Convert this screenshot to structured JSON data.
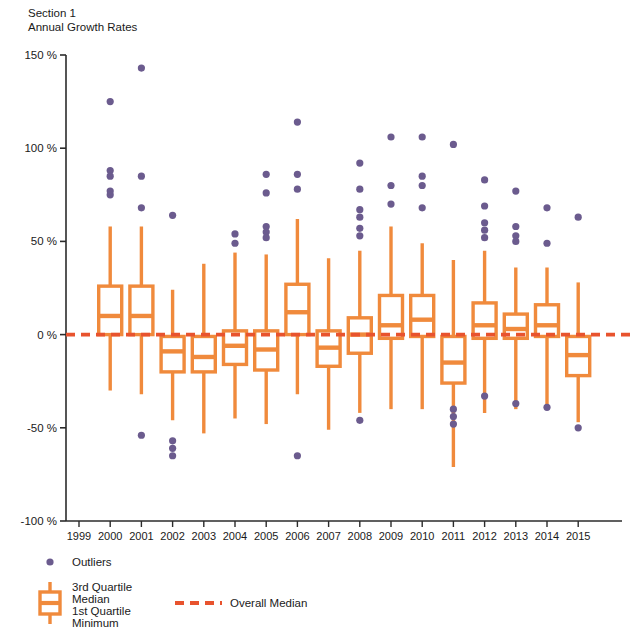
{
  "header": {
    "section_label": "Section 1",
    "chart_title": "Annual Growth Rates"
  },
  "colors": {
    "box": "#F08A3C",
    "outlier": "#6B5B8E",
    "overall_median": "#E8532E",
    "axis": "#2b2b2b",
    "background": "#ffffff"
  },
  "legend": {
    "outliers_label": "Outliers",
    "third_quartile_label": "3rd Quartile",
    "median_label": "Median",
    "first_quartile_label": "1st Quartile",
    "minimum_label": "Minimum",
    "overall_median_label": "Overall Median"
  },
  "chart_data": {
    "type": "box",
    "title": "Annual Growth Rates",
    "subtitle": "Section 1",
    "xlabel": "",
    "ylabel": "",
    "ylim": [
      -100,
      150
    ],
    "yticks": [
      150,
      100,
      50,
      0,
      -50,
      -100
    ],
    "ytick_labels": [
      "150 %",
      "100 %",
      "50 %",
      "0 %",
      "-50 %",
      "-100 %"
    ],
    "grid": false,
    "legend_position": "below-axes",
    "overall_median": 0,
    "categories": [
      "1999",
      "2000",
      "2001",
      "2002",
      "2003",
      "2004",
      "2005",
      "2006",
      "2007",
      "2008",
      "2009",
      "2010",
      "2011",
      "2012",
      "2013",
      "2014",
      "2015"
    ],
    "boxes": [
      {
        "year": "1999",
        "min": null,
        "q1": null,
        "median": null,
        "q3": null,
        "max": null,
        "outliers": []
      },
      {
        "year": "2000",
        "min": -30,
        "q1": 0,
        "median": 10,
        "q3": 26,
        "max": 58,
        "outliers": [
          125,
          88,
          85,
          77,
          75
        ]
      },
      {
        "year": "2001",
        "min": -32,
        "q1": 0,
        "median": 10,
        "q3": 26,
        "max": 58,
        "outliers": [
          143,
          85,
          68,
          -54
        ]
      },
      {
        "year": "2002",
        "min": -46,
        "q1": -20,
        "median": -9,
        "q3": -1,
        "max": 24,
        "outliers": [
          64,
          -57,
          -61,
          -65
        ]
      },
      {
        "year": "2003",
        "min": -53,
        "q1": -20,
        "median": -12,
        "q3": -1,
        "max": 38,
        "outliers": []
      },
      {
        "year": "2004",
        "min": -45,
        "q1": -16,
        "median": -6,
        "q3": 2,
        "max": 44,
        "outliers": [
          54,
          49
        ]
      },
      {
        "year": "2005",
        "min": -48,
        "q1": -19,
        "median": -8,
        "q3": 2,
        "max": 43,
        "outliers": [
          86,
          76,
          58,
          55,
          52
        ]
      },
      {
        "year": "2006",
        "min": -32,
        "q1": 0,
        "median": 12,
        "q3": 27,
        "max": 62,
        "outliers": [
          114,
          86,
          78,
          -65
        ]
      },
      {
        "year": "2007",
        "min": -51,
        "q1": -17,
        "median": -7,
        "q3": 2,
        "max": 41,
        "outliers": []
      },
      {
        "year": "2008",
        "min": -42,
        "q1": -10,
        "median": 0,
        "q3": 9,
        "max": 45,
        "outliers": [
          92,
          78,
          67,
          63,
          57,
          53,
          -46
        ]
      },
      {
        "year": "2009",
        "min": -40,
        "q1": -2,
        "median": 5,
        "q3": 21,
        "max": 58,
        "outliers": [
          106,
          80,
          70
        ]
      },
      {
        "year": "2010",
        "min": -40,
        "q1": -1,
        "median": 8,
        "q3": 21,
        "max": 49,
        "outliers": [
          106,
          85,
          80,
          68
        ]
      },
      {
        "year": "2011",
        "min": -71,
        "q1": -26,
        "median": -15,
        "q3": -1,
        "max": 40,
        "outliers": [
          102,
          -40,
          -44,
          -48
        ]
      },
      {
        "year": "2012",
        "min": -42,
        "q1": -2,
        "median": 5,
        "q3": 17,
        "max": 45,
        "outliers": [
          83,
          69,
          60,
          56,
          52,
          -33
        ]
      },
      {
        "year": "2013",
        "min": -40,
        "q1": -2,
        "median": 3,
        "q3": 11,
        "max": 36,
        "outliers": [
          77,
          58,
          53,
          50,
          -37
        ]
      },
      {
        "year": "2014",
        "min": -38,
        "q1": -1,
        "median": 5,
        "q3": 16,
        "max": 36,
        "outliers": [
          68,
          49,
          -39
        ]
      },
      {
        "year": "2015",
        "min": -47,
        "q1": -22,
        "median": -11,
        "q3": -1,
        "max": 28,
        "outliers": [
          63,
          -50
        ]
      }
    ]
  }
}
